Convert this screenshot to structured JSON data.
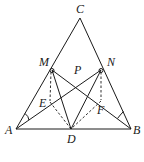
{
  "figure": {
    "labels": {
      "C": "C",
      "M": "M",
      "N": "N",
      "P": "P",
      "E": "E",
      "F": "F",
      "A": "A",
      "D": "D",
      "B": "B"
    },
    "points": {
      "A": [
        16,
        129
      ],
      "B": [
        131,
        129
      ],
      "C": [
        80,
        18
      ],
      "D": [
        71,
        129
      ],
      "M": [
        52,
        70
      ],
      "N": [
        101,
        70
      ],
      "P": [
        78,
        77
      ],
      "E": [
        50,
        103
      ],
      "F": [
        101,
        101
      ]
    },
    "solid_segments": [
      "AB",
      "AC",
      "BC",
      "MB",
      "NA",
      "MD",
      "ND"
    ],
    "dashed_segments": [
      "ME",
      "ED",
      "NF",
      "FD"
    ],
    "angle_marks": [
      "A",
      "B"
    ],
    "caption": ""
  }
}
